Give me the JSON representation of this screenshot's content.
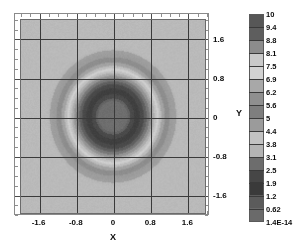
{
  "chart_data": {
    "type": "heatmap",
    "title": "",
    "xlabel": "X",
    "ylabel": "Y",
    "xlim": [
      -2.0,
      2.0
    ],
    "ylim": [
      -2.0,
      2.0
    ],
    "xticks": [
      "-1.6",
      "-0.8",
      "0",
      "0.8",
      "1.6"
    ],
    "xtick_values": [
      -1.6,
      -0.8,
      0,
      0.8,
      1.6
    ],
    "yticks": [
      "1.6",
      "0.8",
      "0",
      "-0.8",
      "-1.6"
    ],
    "ytick_values": [
      1.6,
      0.8,
      0,
      -0.8,
      -1.6
    ],
    "grid": true,
    "legend": "none",
    "colorbar": {
      "position": "right",
      "orientation": "vertical",
      "min": 0,
      "max": 10,
      "labels": [
        "10",
        "9.4",
        "8.8",
        "8.1",
        "7.5",
        "6.9",
        "6.2",
        "5.6",
        "5",
        "4.4",
        "3.8",
        "3.1",
        "2.5",
        "1.9",
        "1.2",
        "0.62",
        "1.4E-14"
      ],
      "values": [
        10,
        9.4,
        8.8,
        8.1,
        7.5,
        6.9,
        6.2,
        5.6,
        5,
        4.4,
        3.8,
        3.1,
        2.5,
        1.9,
        1.2,
        0.62,
        1.4e-14
      ],
      "band_colors": [
        "#575757",
        "#5e5e5e",
        "#8c8c8c",
        "#c9c9c9",
        "#d2d2d2",
        "#a8a8a8",
        "#8f8f8f",
        "#7e7e7e",
        "#9b9b9b",
        "#c2c2c2",
        "#b4b4b4",
        "#6d6d6d",
        "#464646",
        "#3a3a3a",
        "#5b5b5b",
        "#6a6a6a"
      ]
    },
    "field": {
      "description": "radially symmetric concentric ring field",
      "center": [
        0,
        0
      ],
      "radial_stops": [
        {
          "r": 0.0,
          "color": "#6e6e6e"
        },
        {
          "r": 0.3,
          "color": "#6e6e6e"
        },
        {
          "r": 0.34,
          "color": "#646464"
        },
        {
          "r": 0.4,
          "color": "#4b4b4b"
        },
        {
          "r": 0.52,
          "color": "#3f3f3f"
        },
        {
          "r": 0.64,
          "color": "#4a4a4a"
        },
        {
          "r": 0.7,
          "color": "#5f5f5f"
        },
        {
          "r": 0.76,
          "color": "#777777"
        },
        {
          "r": 0.82,
          "color": "#949494"
        },
        {
          "r": 0.87,
          "color": "#ababab"
        },
        {
          "r": 0.92,
          "color": "#c0c0c0"
        },
        {
          "r": 0.97,
          "color": "#cfcfcf"
        },
        {
          "r": 1.02,
          "color": "#bdbdbd"
        },
        {
          "r": 1.08,
          "color": "#a3a3a3"
        },
        {
          "r": 1.16,
          "color": "#8d8d8d"
        },
        {
          "r": 1.3,
          "color": "#9d9d9d"
        },
        {
          "r": 1.45,
          "color": "#bababa"
        }
      ]
    }
  },
  "axes": {
    "x_title": "X",
    "y_title": "Y"
  }
}
